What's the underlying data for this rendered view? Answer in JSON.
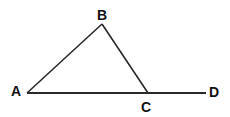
{
  "diagram": {
    "type": "geometry",
    "stroke_color": "#2a2a2a",
    "points": {
      "A": {
        "label": "A",
        "x": 27,
        "y": 93
      },
      "B": {
        "label": "B",
        "x": 102,
        "y": 24
      },
      "C": {
        "label": "C",
        "x": 148,
        "y": 93
      },
      "D": {
        "label": "D",
        "x": 206,
        "y": 93
      }
    },
    "segments": [
      {
        "from": "A",
        "to": "B"
      },
      {
        "from": "B",
        "to": "C"
      },
      {
        "from": "A",
        "to": "D"
      }
    ]
  }
}
